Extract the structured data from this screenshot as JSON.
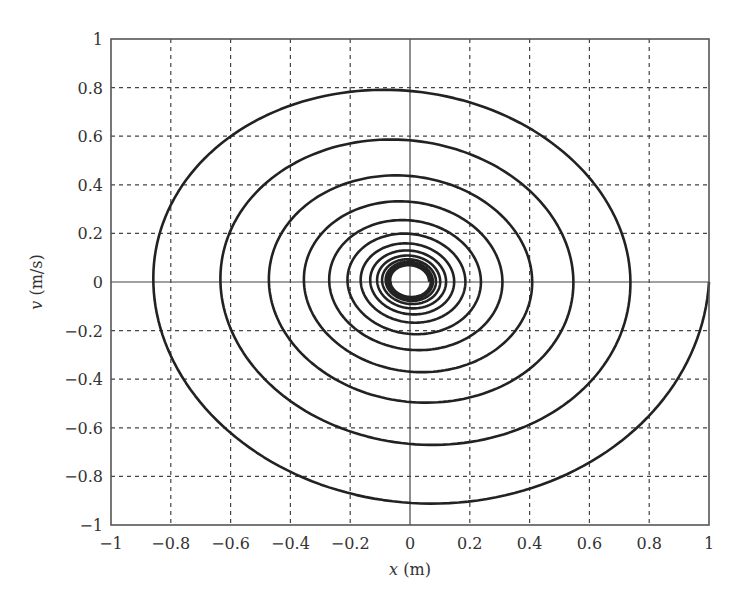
{
  "chart_data": {
    "type": "line",
    "title": "",
    "xlabel_var": "x",
    "xlabel_unit": " (m)",
    "ylabel_var": "v",
    "ylabel_unit": " (m/s)",
    "xlim": [
      -1,
      1
    ],
    "ylim": [
      -1,
      1
    ],
    "xticks": [
      -1,
      -0.8,
      -0.6,
      -0.4,
      -0.2,
      0,
      0.2,
      0.4,
      0.6,
      0.8,
      1
    ],
    "yticks": [
      -1,
      -0.8,
      -0.6,
      -0.4,
      -0.2,
      0,
      0.2,
      0.4,
      0.6,
      0.8,
      1
    ],
    "xtick_labels": [
      "−1",
      "−0.8",
      "−0.6",
      "−0.4",
      "−0.2",
      "0",
      "0.2",
      "0.4",
      "0.6",
      "0.8",
      "1"
    ],
    "ytick_labels": [
      "−1",
      "−0.8",
      "−0.6",
      "−0.4",
      "−0.2",
      "0",
      "0.2",
      "0.4",
      "0.6",
      "0.8",
      "1"
    ],
    "grid": true,
    "legend": null,
    "series": [
      {
        "name": "phase trajectory",
        "description": "Damped oscillation phase portrait, clockwise spiral starting at (1, 0) converging near origin",
        "start": [
          1,
          0
        ],
        "x_axis_crossings_right": [
          1.0,
          0.735,
          0.545,
          0.4,
          0.295,
          0.21,
          0.165
        ],
        "x_axis_crossings_left": [
          -0.87,
          -0.64,
          -0.47,
          -0.35,
          -0.26,
          -0.19
        ],
        "v_troughs": [
          -0.985,
          -0.71,
          -0.53,
          -0.39,
          -0.29
        ],
        "v_peaks": [
          0.85,
          0.63,
          0.47,
          0.355,
          0.27
        ],
        "model": {
          "half_cycle_decay": 0.85,
          "asymptotic_radius": 0.05,
          "v_scale": 0.985,
          "half_cycles": 26,
          "center": [
            0.0,
            0.005
          ]
        }
      }
    ]
  },
  "colors": {
    "curve": "#222222",
    "grid": "#444444",
    "frame": "#555555",
    "text": "#333333",
    "background": "#ffffff"
  }
}
